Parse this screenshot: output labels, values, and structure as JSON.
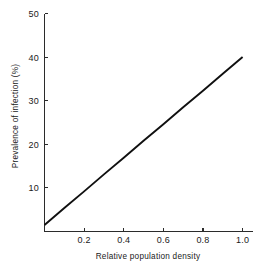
{
  "chart_data": {
    "type": "line",
    "title": "",
    "subtitle": "",
    "xlabel": "Relative population density",
    "ylabel": "Prevalence of infection (%)",
    "xlim": [
      0,
      1.05
    ],
    "ylim": [
      0,
      50
    ],
    "grid": false,
    "legend": null,
    "legend_position": "none",
    "x_ticks": [
      0.2,
      0.4,
      0.6,
      0.8,
      1.0
    ],
    "x_tick_labels": [
      "0.2",
      "0.4",
      "0.6",
      "0.8",
      "1.0"
    ],
    "y_ticks": [
      10,
      20,
      30,
      40,
      50
    ],
    "y_tick_labels": [
      "10",
      "20",
      "30",
      "40",
      "50"
    ],
    "tick_direction": "in",
    "series": [
      {
        "name": "prevalence",
        "color": "#101010",
        "x": [
          0.0,
          0.1,
          0.2,
          0.3,
          0.4,
          0.5,
          0.6,
          0.7,
          0.8,
          0.9,
          1.0
        ],
        "values": [
          1.5,
          5.4,
          9.2,
          13.1,
          16.9,
          20.8,
          24.6,
          28.5,
          32.3,
          36.2,
          40.0
        ]
      }
    ],
    "annotations": []
  },
  "axis_color": "#2b2b2b",
  "background_color": "#ffffff"
}
